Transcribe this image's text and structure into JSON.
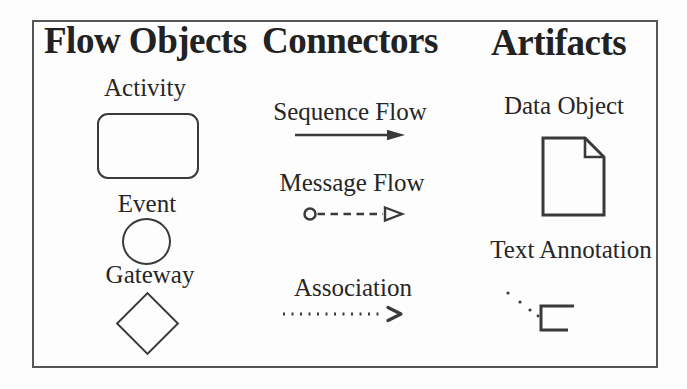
{
  "palette": {
    "ink": "#262626",
    "shape_stroke": "#3a3a3a",
    "frame_border": "#565656",
    "background": "#fcfcfc"
  },
  "columns": [
    {
      "heading": "Flow Objects",
      "items": [
        {
          "label": "Activity",
          "icon": "rounded-rectangle"
        },
        {
          "label": "Event",
          "icon": "circle"
        },
        {
          "label": "Gateway",
          "icon": "diamond"
        }
      ]
    },
    {
      "heading": "Connectors",
      "items": [
        {
          "label": "Sequence Flow",
          "icon": "solid-line-filled-arrow"
        },
        {
          "label": "Message Flow",
          "icon": "open-circle-dashed-line-open-arrow"
        },
        {
          "label": "Association",
          "icon": "dotted-line-thin-arrow"
        }
      ]
    },
    {
      "heading": "Artifacts",
      "items": [
        {
          "label": "Data Object",
          "icon": "document-folded-corner"
        },
        {
          "label": "Text Annotation",
          "icon": "open-bracket-dotted-line"
        }
      ]
    }
  ]
}
